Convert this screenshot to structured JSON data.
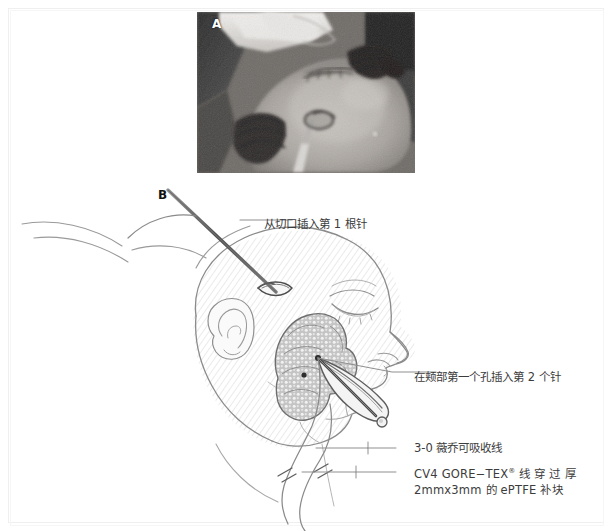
{
  "figure": {
    "panels": [
      {
        "id": "A",
        "letter": "A",
        "type": "photograph",
        "description": "intraoperative-photo"
      },
      {
        "id": "B",
        "letter": "B",
        "type": "line-illustration",
        "description": "facial-profile-diagram"
      }
    ],
    "labels": {
      "needle_one": "从切口插入第 1 根针",
      "needle_two": "在颊部第一个孔插入第 2 个针",
      "vicryl": "3-0 薇乔可吸收线",
      "goretex_line1": "CV4 GORE−TEX",
      "goretex_reg": "®",
      "goretex_line1_tail": " 线 穿 过 厚",
      "goretex_line2": "2mmx3mm 的 ePTFE 补块"
    },
    "colors": {
      "ink": "#3c3c3c",
      "line": "#6b6b6b",
      "hatch": "#d8d8d8",
      "patch_fill": "#c9c9c9",
      "border": "#efefef",
      "background": "#ffffff"
    }
  }
}
